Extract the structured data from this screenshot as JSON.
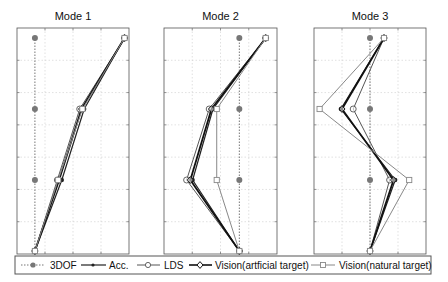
{
  "chart_data": [
    {
      "type": "line",
      "title": "Mode 1",
      "orientation": "vertical-profile",
      "levels": [
        1,
        2,
        3,
        4
      ],
      "xlim": [
        -0.2,
        1.05
      ],
      "grid": true,
      "series": [
        {
          "name": "3DOF",
          "values": [
            0,
            0,
            0,
            0
          ]
        },
        {
          "name": "Acc.",
          "values": [
            0,
            0.3,
            0.55,
            1.0
          ]
        },
        {
          "name": "LDS",
          "values": [
            0,
            0.25,
            0.5,
            1.0
          ]
        },
        {
          "name": "Vision(artficial target)",
          "values": [
            0,
            0.27,
            0.52,
            1.0
          ]
        },
        {
          "name": "Vision(natural target)",
          "values": [
            0,
            0.26,
            0.53,
            1.0
          ]
        }
      ]
    },
    {
      "type": "line",
      "title": "Mode 2",
      "orientation": "vertical-profile",
      "levels": [
        1,
        2,
        3,
        4
      ],
      "xlim": [
        -1.0,
        0.5
      ],
      "grid": true,
      "series": [
        {
          "name": "3DOF",
          "values": [
            0,
            0,
            0,
            0
          ]
        },
        {
          "name": "Acc.",
          "values": [
            0,
            -0.62,
            -0.35,
            0.35
          ]
        },
        {
          "name": "LDS",
          "values": [
            0,
            -0.7,
            -0.4,
            0.35
          ]
        },
        {
          "name": "Vision(artficial target)",
          "values": [
            0,
            -0.65,
            -0.37,
            0.35
          ]
        },
        {
          "name": "Vision(natural target)",
          "values": [
            0,
            -0.3,
            -0.3,
            0.35
          ]
        }
      ]
    },
    {
      "type": "line",
      "title": "Mode 3",
      "orientation": "vertical-profile",
      "levels": [
        1,
        2,
        3,
        4
      ],
      "xlim": [
        -1.0,
        1.0
      ],
      "grid": true,
      "series": [
        {
          "name": "3DOF",
          "values": [
            0,
            0,
            0,
            0
          ]
        },
        {
          "name": "Acc.",
          "values": [
            0,
            0.45,
            -0.52,
            0.25
          ]
        },
        {
          "name": "LDS",
          "values": [
            0,
            0.35,
            -0.3,
            0.25
          ]
        },
        {
          "name": "Vision(artficial target)",
          "values": [
            0,
            0.42,
            -0.5,
            0.25
          ]
        },
        {
          "name": "Vision(natural target)",
          "values": [
            0,
            0.7,
            -0.9,
            0.25
          ]
        }
      ]
    }
  ],
  "legend": {
    "items": [
      {
        "label": "3DOF",
        "marker": "filled-circle-dotted-line"
      },
      {
        "label": "Acc.",
        "marker": "small-dot-solid-line"
      },
      {
        "label": "LDS",
        "marker": "open-circle-line"
      },
      {
        "label": "Vision(artficial target)",
        "marker": "open-diamond-thick-line"
      },
      {
        "label": "Vision(natural target)",
        "marker": "open-square-gray-line"
      }
    ]
  },
  "colors": {
    "dof3": "#666666",
    "acc": "#222222",
    "lds": "#555555",
    "vision_art": "#111111",
    "vision_nat": "#888888",
    "grid": "#cccccc",
    "axis": "#555555"
  }
}
